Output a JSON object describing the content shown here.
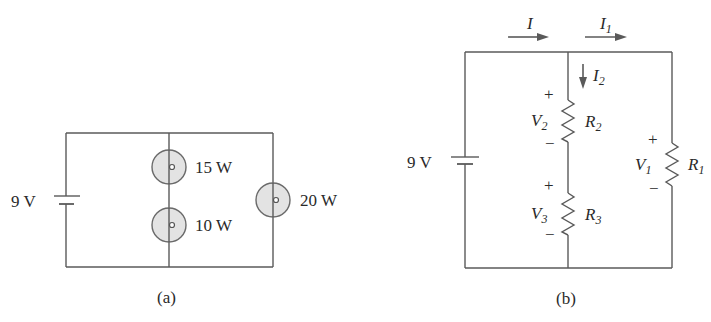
{
  "figure": {
    "panel_a": {
      "caption": "(a)",
      "source_label": "9 V",
      "lamps": [
        {
          "label": "15 W",
          "position": "middle-branch-top"
        },
        {
          "label": "10 W",
          "position": "middle-branch-bottom"
        },
        {
          "label": "20 W",
          "position": "right-branch"
        }
      ]
    },
    "panel_b": {
      "caption": "(b)",
      "source_label": "9 V",
      "currents": [
        {
          "symbol": "I",
          "sub": "",
          "direction": "right"
        },
        {
          "symbol": "I",
          "sub": "1",
          "direction": "right"
        },
        {
          "symbol": "I",
          "sub": "2",
          "direction": "down"
        }
      ],
      "resistors": [
        {
          "name": "R",
          "sub": "2",
          "voltage": "V",
          "vsub": "2",
          "plus": "+",
          "minus": "−"
        },
        {
          "name": "R",
          "sub": "3",
          "voltage": "V",
          "vsub": "3",
          "plus": "+",
          "minus": "−"
        },
        {
          "name": "R",
          "sub": "1",
          "voltage": "V",
          "vsub": "1",
          "plus": "+",
          "minus": "−"
        }
      ]
    }
  }
}
